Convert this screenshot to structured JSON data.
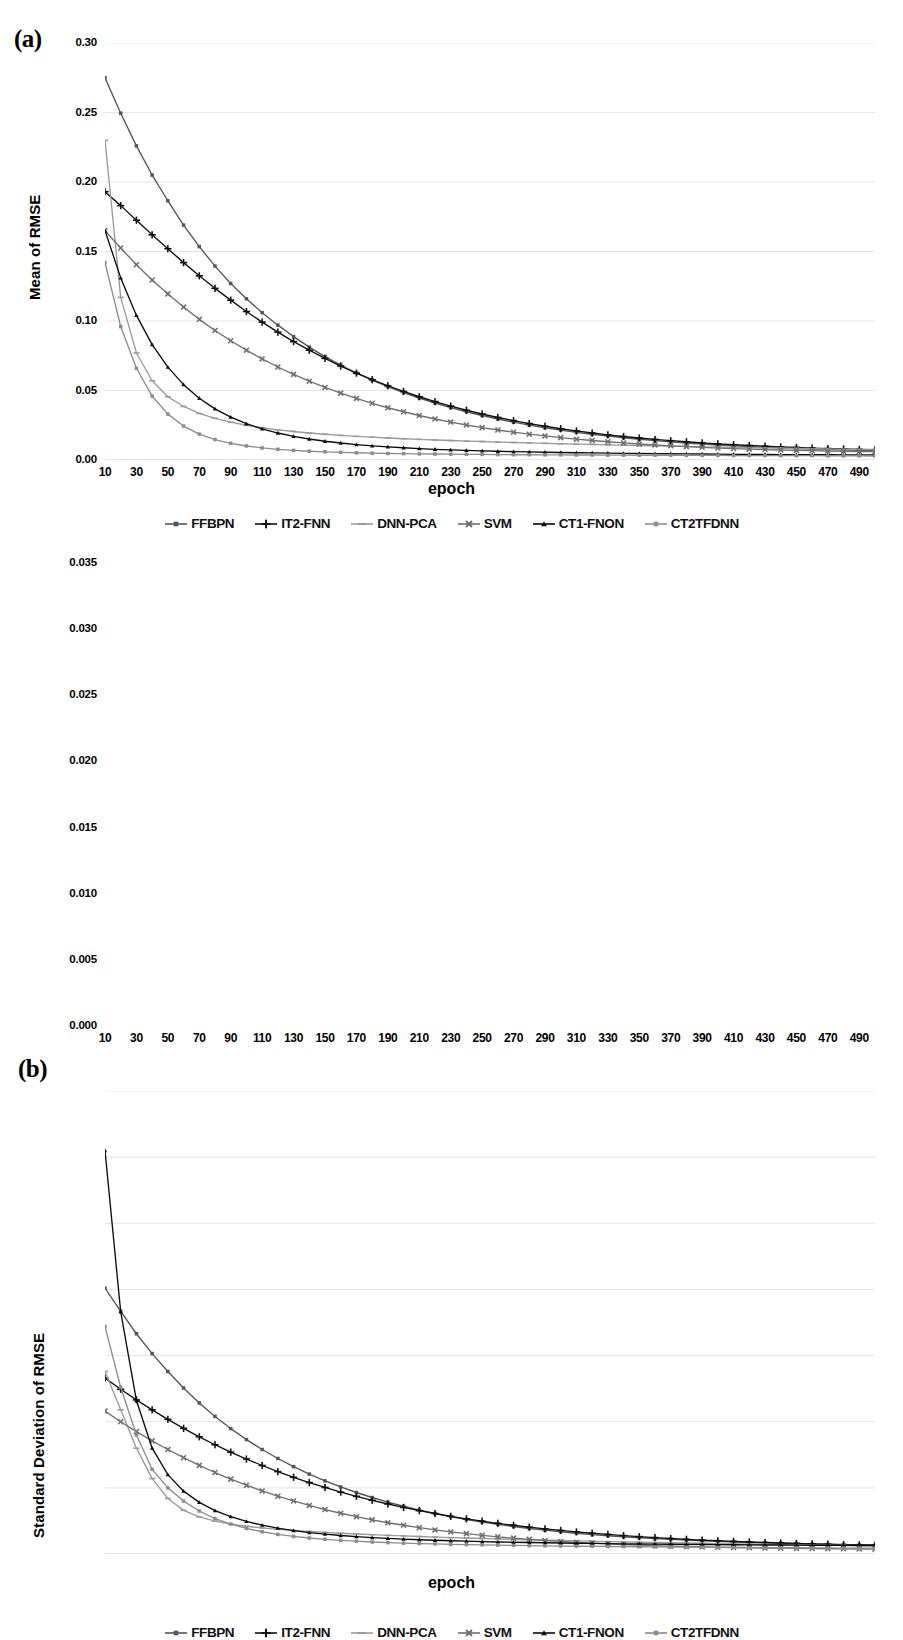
{
  "figure": {
    "panels": [
      {
        "tag": "(a)",
        "ylabel": "Mean of RMSE",
        "xlabel": "epoch"
      },
      {
        "tag": "(b)",
        "ylabel": "Standard Deviation of RMSE",
        "xlabel": "epoch"
      }
    ],
    "legend_items": [
      {
        "label": "FFBPN",
        "marker": "diamond",
        "color": "#555555"
      },
      {
        "label": "IT2-FNN",
        "marker": "plus",
        "color": "#111111"
      },
      {
        "label": "DNN-PCA",
        "marker": "dash",
        "color": "#9a9a9a"
      },
      {
        "label": "SVM",
        "marker": "x",
        "color": "#6f6f6f"
      },
      {
        "label": "CT1-FNON",
        "marker": "triangle",
        "color": "#0b0b0b"
      },
      {
        "label": "CT2TFDNN",
        "marker": "square",
        "color": "#8c8c8c"
      }
    ]
  },
  "chart_data": [
    {
      "type": "line",
      "panel": "(a)",
      "title": "",
      "xlabel": "epoch",
      "ylabel": "Mean of RMSE",
      "xlim": [
        10,
        500
      ],
      "ylim": [
        0.0,
        0.3
      ],
      "grid": true,
      "legend_position": "bottom",
      "ytick_labels": [
        "0.00",
        "0.05",
        "0.10",
        "0.15",
        "0.20",
        "0.25",
        "0.30"
      ],
      "ytick_values": [
        0.0,
        0.05,
        0.1,
        0.15,
        0.2,
        0.25,
        0.3
      ],
      "xtick_labels": [
        "10",
        "30",
        "50",
        "70",
        "90",
        "110",
        "130",
        "150",
        "170",
        "190",
        "210",
        "230",
        "250",
        "270",
        "290",
        "310",
        "330",
        "350",
        "370",
        "390",
        "410",
        "430",
        "450",
        "470",
        "490"
      ],
      "xtick_values": [
        10,
        30,
        50,
        70,
        90,
        110,
        130,
        150,
        170,
        190,
        210,
        230,
        250,
        270,
        290,
        310,
        330,
        350,
        370,
        390,
        410,
        430,
        450,
        470,
        490
      ],
      "x": [
        10,
        20,
        30,
        40,
        50,
        60,
        70,
        80,
        90,
        100,
        110,
        120,
        130,
        140,
        150,
        160,
        170,
        180,
        190,
        200,
        210,
        220,
        230,
        240,
        250,
        260,
        270,
        280,
        290,
        300,
        310,
        320,
        330,
        340,
        350,
        360,
        370,
        380,
        390,
        400,
        410,
        420,
        430,
        440,
        450,
        460,
        470,
        480,
        490,
        500
      ],
      "series": [
        {
          "name": "FFBPN",
          "marker": "diamond",
          "color": "#555555",
          "values": [
            0.275,
            0.2495,
            0.226,
            0.205,
            0.1865,
            0.169,
            0.1535,
            0.1395,
            0.127,
            0.116,
            0.106,
            0.097,
            0.0888,
            0.0812,
            0.0744,
            0.0682,
            0.0626,
            0.0575,
            0.0528,
            0.0485,
            0.0446,
            0.041,
            0.0377,
            0.0347,
            0.032,
            0.0295,
            0.0272,
            0.0251,
            0.0232,
            0.0215,
            0.0199,
            0.0185,
            0.0172,
            0.016,
            0.0149,
            0.0139,
            0.013,
            0.0122,
            0.0114,
            0.0108,
            0.0102,
            0.0096,
            0.0091,
            0.0087,
            0.0083,
            0.0079,
            0.0076,
            0.0073,
            0.007,
            0.0068
          ]
        },
        {
          "name": "IT2-FNN",
          "marker": "plus",
          "color": "#111111",
          "values": [
            0.193,
            0.183,
            0.1725,
            0.162,
            0.152,
            0.142,
            0.1325,
            0.1235,
            0.115,
            0.1068,
            0.0992,
            0.092,
            0.0852,
            0.079,
            0.0731,
            0.0676,
            0.0625,
            0.0578,
            0.0534,
            0.0493,
            0.0455,
            0.042,
            0.0388,
            0.0358,
            0.0331,
            0.0306,
            0.0283,
            0.0262,
            0.0243,
            0.0225,
            0.0209,
            0.0194,
            0.0181,
            0.0169,
            0.0158,
            0.0148,
            0.0139,
            0.0131,
            0.0123,
            0.0116,
            0.011,
            0.0104,
            0.0099,
            0.0094,
            0.009,
            0.0086,
            0.0082,
            0.0079,
            0.0076,
            0.0074
          ]
        },
        {
          "name": "DNN-PCA",
          "marker": "dash",
          "color": "#9a9a9a",
          "values": [
            0.23,
            0.117,
            0.077,
            0.057,
            0.0455,
            0.0385,
            0.0335,
            0.03,
            0.0272,
            0.025,
            0.0232,
            0.0217,
            0.0205,
            0.0194,
            0.0185,
            0.0177,
            0.017,
            0.0164,
            0.0158,
            0.0153,
            0.0148,
            0.0144,
            0.014,
            0.0136,
            0.0133,
            0.0129,
            0.0126,
            0.0123,
            0.012,
            0.0117,
            0.0114,
            0.0112,
            0.0109,
            0.0107,
            0.0104,
            0.0102,
            0.01,
            0.0098,
            0.0095,
            0.0093,
            0.0091,
            0.0089,
            0.0087,
            0.0085,
            0.0083,
            0.0081,
            0.0079,
            0.0077,
            0.0076,
            0.0074
          ]
        },
        {
          "name": "SVM",
          "marker": "x",
          "color": "#6f6f6f",
          "values": [
            0.165,
            0.1525,
            0.1405,
            0.1295,
            0.1195,
            0.11,
            0.1012,
            0.0932,
            0.0858,
            0.079,
            0.0727,
            0.0669,
            0.0616,
            0.0567,
            0.0522,
            0.0481,
            0.0443,
            0.0408,
            0.0376,
            0.0347,
            0.032,
            0.0295,
            0.0273,
            0.0252,
            0.0233,
            0.0216,
            0.02,
            0.0186,
            0.0173,
            0.0161,
            0.015,
            0.014,
            0.0131,
            0.0123,
            0.0115,
            0.0108,
            0.0102,
            0.0096,
            0.0091,
            0.0086,
            0.0082,
            0.0078,
            0.0075,
            0.0072,
            0.0069,
            0.0067,
            0.0065,
            0.0063,
            0.0061,
            0.006
          ]
        },
        {
          "name": "CT1-FNON",
          "marker": "triangle",
          "color": "#0b0b0b",
          "values": [
            0.165,
            0.131,
            0.104,
            0.083,
            0.0668,
            0.0542,
            0.0444,
            0.0368,
            0.0308,
            0.0261,
            0.0224,
            0.0194,
            0.017,
            0.0151,
            0.0135,
            0.0122,
            0.0111,
            0.0102,
            0.0094,
            0.0088,
            0.0082,
            0.0077,
            0.0073,
            0.0069,
            0.0066,
            0.0063,
            0.006,
            0.0058,
            0.0056,
            0.0054,
            0.0052,
            0.0051,
            0.0049,
            0.0048,
            0.0047,
            0.0046,
            0.0045,
            0.0044,
            0.0043,
            0.0042,
            0.0041,
            0.0041,
            0.004,
            0.0039,
            0.0039,
            0.0038,
            0.0038,
            0.0037,
            0.0037,
            0.0036
          ]
        },
        {
          "name": "CT2TFDNN",
          "marker": "square",
          "color": "#8c8c8c",
          "values": [
            0.142,
            0.096,
            0.066,
            0.046,
            0.033,
            0.0244,
            0.0186,
            0.0147,
            0.012,
            0.0101,
            0.0087,
            0.0077,
            0.0069,
            0.0063,
            0.0059,
            0.0055,
            0.0052,
            0.0049,
            0.0047,
            0.0046,
            0.0044,
            0.0043,
            0.0042,
            0.0041,
            0.004,
            0.0039,
            0.0038,
            0.0038,
            0.0037,
            0.0037,
            0.0036,
            0.0036,
            0.0035,
            0.0035,
            0.0034,
            0.0034,
            0.0034,
            0.0033,
            0.0033,
            0.0033,
            0.0032,
            0.0032,
            0.0032,
            0.0031,
            0.0031,
            0.0031,
            0.003,
            0.003,
            0.003,
            0.0029
          ]
        }
      ]
    },
    {
      "type": "line",
      "panel": "(b)",
      "title": "",
      "xlabel": "epoch",
      "ylabel": "Standard Deviation of RMSE",
      "xlim": [
        10,
        500
      ],
      "ylim": [
        0.0,
        0.035
      ],
      "grid": true,
      "legend_position": "bottom",
      "ytick_labels": [
        "0.000",
        "0.005",
        "0.010",
        "0.015",
        "0.020",
        "0.025",
        "0.030",
        "0.035"
      ],
      "ytick_values": [
        0.0,
        0.005,
        0.01,
        0.015,
        0.02,
        0.025,
        0.03,
        0.035
      ],
      "xtick_labels": [
        "10",
        "30",
        "50",
        "70",
        "90",
        "110",
        "130",
        "150",
        "170",
        "190",
        "210",
        "230",
        "250",
        "270",
        "290",
        "310",
        "330",
        "350",
        "370",
        "390",
        "410",
        "430",
        "450",
        "470",
        "490"
      ],
      "xtick_values": [
        10,
        30,
        50,
        70,
        90,
        110,
        130,
        150,
        170,
        190,
        210,
        230,
        250,
        270,
        290,
        310,
        330,
        350,
        370,
        390,
        410,
        430,
        450,
        470,
        490
      ],
      "x": [
        10,
        20,
        30,
        40,
        50,
        60,
        70,
        80,
        90,
        100,
        110,
        120,
        130,
        140,
        150,
        160,
        170,
        180,
        190,
        200,
        210,
        220,
        230,
        240,
        250,
        260,
        270,
        280,
        290,
        300,
        310,
        320,
        330,
        340,
        350,
        360,
        370,
        380,
        390,
        400,
        410,
        420,
        430,
        440,
        450,
        460,
        470,
        480,
        490,
        500
      ],
      "series": [
        {
          "name": "FFBPN",
          "marker": "diamond",
          "color": "#555555",
          "values": [
            0.0201,
            0.01835,
            0.01665,
            0.01515,
            0.0138,
            0.01255,
            0.01142,
            0.0104,
            0.00948,
            0.00865,
            0.0079,
            0.00722,
            0.0066,
            0.00604,
            0.00553,
            0.00507,
            0.00465,
            0.00427,
            0.00392,
            0.00361,
            0.00332,
            0.00306,
            0.00283,
            0.00261,
            0.00242,
            0.00224,
            0.00208,
            0.00193,
            0.0018,
            0.00168,
            0.00157,
            0.00147,
            0.00138,
            0.0013,
            0.00123,
            0.00116,
            0.0011,
            0.00105,
            0.001,
            0.00095,
            0.00091,
            0.00087,
            0.00084,
            0.00081,
            0.00078,
            0.00075,
            0.00073,
            0.00071,
            0.00069,
            0.00067
          ]
        },
        {
          "name": "IT2-FNN",
          "marker": "plus",
          "color": "#111111",
          "values": [
            0.0133,
            0.01245,
            0.01165,
            0.0109,
            0.01018,
            0.0095,
            0.00886,
            0.00826,
            0.0077,
            0.00718,
            0.00669,
            0.00623,
            0.0058,
            0.0054,
            0.00503,
            0.00468,
            0.00436,
            0.00406,
            0.00378,
            0.00352,
            0.00328,
            0.00306,
            0.00285,
            0.00266,
            0.00248,
            0.00232,
            0.00217,
            0.00203,
            0.0019,
            0.00178,
            0.00167,
            0.00157,
            0.00148,
            0.00139,
            0.00131,
            0.00124,
            0.00117,
            0.00111,
            0.00105,
            0.001,
            0.00095,
            0.00091,
            0.00087,
            0.00083,
            0.0008,
            0.00077,
            0.00074,
            0.00071,
            0.00069,
            0.00067
          ]
        },
        {
          "name": "DNN-PCA",
          "marker": "dash",
          "color": "#9a9a9a",
          "values": [
            0.0138,
            0.0109,
            0.008,
            0.0057,
            0.0042,
            0.0033,
            0.0028,
            0.00248,
            0.00226,
            0.0021,
            0.00197,
            0.00187,
            0.00178,
            0.0017,
            0.00163,
            0.00157,
            0.00151,
            0.00146,
            0.00141,
            0.00137,
            0.00132,
            0.00128,
            0.00124,
            0.00121,
            0.00117,
            0.00114,
            0.00111,
            0.00108,
            0.00105,
            0.00102,
            0.00099,
            0.00097,
            0.00094,
            0.00092,
            0.00089,
            0.00087,
            0.00085,
            0.00083,
            0.00081,
            0.00079,
            0.00077,
            0.00075,
            0.00073,
            0.00071,
            0.0007,
            0.00068,
            0.00066,
            0.00065,
            0.00063,
            0.00062
          ]
        },
        {
          "name": "SVM",
          "marker": "x",
          "color": "#6f6f6f",
          "values": [
            0.0108,
            0.01,
            0.00925,
            0.00855,
            0.0079,
            0.00728,
            0.0067,
            0.00616,
            0.00566,
            0.0052,
            0.00477,
            0.00437,
            0.00401,
            0.00367,
            0.00336,
            0.00308,
            0.00282,
            0.00258,
            0.00236,
            0.00217,
            0.00199,
            0.00182,
            0.00167,
            0.00154,
            0.00141,
            0.0013,
            0.0012,
            0.00111,
            0.00102,
            0.00095,
            0.00088,
            0.00082,
            0.00077,
            0.00072,
            0.00067,
            0.00063,
            0.0006,
            0.00057,
            0.00054,
            0.00051,
            0.00049,
            0.00047,
            0.00045,
            0.00044,
            0.00042,
            0.00041,
            0.0004,
            0.00039,
            0.00038,
            0.00037
          ]
        },
        {
          "name": "CT1-FNON",
          "marker": "triangle",
          "color": "#0b0b0b",
          "values": [
            0.0305,
            0.0183,
            0.0116,
            0.008,
            0.006,
            0.00475,
            0.0039,
            0.00328,
            0.00282,
            0.00246,
            0.00218,
            0.00195,
            0.00177,
            0.00162,
            0.0015,
            0.0014,
            0.00131,
            0.00124,
            0.00118,
            0.00113,
            0.00108,
            0.00104,
            0.001,
            0.00097,
            0.00094,
            0.00091,
            0.00089,
            0.00087,
            0.00085,
            0.00083,
            0.00081,
            0.0008,
            0.00078,
            0.00077,
            0.00076,
            0.00075,
            0.00074,
            0.00073,
            0.00072,
            0.00071,
            0.0007,
            0.00069,
            0.00068,
            0.00068,
            0.00067,
            0.00066,
            0.00066,
            0.00065,
            0.00064,
            0.00064
          ]
        },
        {
          "name": "CT2TFDNN",
          "marker": "square",
          "color": "#8c8c8c",
          "values": [
            0.0172,
            0.0126,
            0.009,
            0.0064,
            0.005,
            0.004,
            0.00325,
            0.00268,
            0.00226,
            0.00193,
            0.00168,
            0.00148,
            0.00133,
            0.00121,
            0.00111,
            0.00103,
            0.00097,
            0.00091,
            0.00086,
            0.00082,
            0.00079,
            0.00076,
            0.00073,
            0.00071,
            0.00069,
            0.00067,
            0.00065,
            0.00063,
            0.00062,
            0.0006,
            0.00059,
            0.00058,
            0.00057,
            0.00056,
            0.00055,
            0.00054,
            0.00053,
            0.00052,
            0.00051,
            0.0005,
            0.00049,
            0.00049,
            0.00048,
            0.00047,
            0.00047,
            0.00046,
            0.00046,
            0.00045,
            0.00045,
            0.00044
          ]
        }
      ]
    }
  ]
}
